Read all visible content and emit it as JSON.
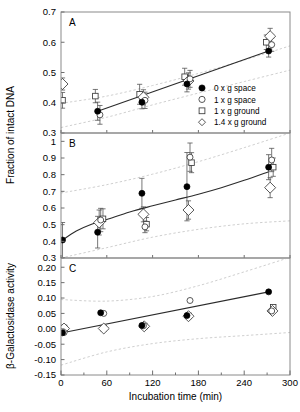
{
  "figure": {
    "xlabel": "Incubation time (min)",
    "ylabel_top": "Fraction of intact DNA",
    "ylabel_bottom": "β-Galactosidase activity",
    "panel_letters": [
      "A",
      "B",
      "C"
    ]
  },
  "legend": {
    "position": "panel-A-lower-right",
    "entries": [
      {
        "marker": "filled-circle",
        "label": "0 x g space"
      },
      {
        "marker": "open-circle",
        "label": "1 x g space"
      },
      {
        "marker": "open-square",
        "label": "1 x g ground"
      },
      {
        "marker": "open-diamond",
        "label": "1.4 x g ground"
      }
    ]
  },
  "colors": {
    "filled_marker": "#000000",
    "open_marker_stroke": "#3a3a3a",
    "fit_line": "#2b2b2b",
    "confidence_band": "#c9c9c9",
    "frame": "#8a8a8a",
    "background": "#ffffff"
  },
  "chart_data": [
    {
      "type": "scatter",
      "panel": "A",
      "title": "A",
      "xlabel": "",
      "ylabel": "Fraction of intact DNA",
      "xlim": [
        0,
        300
      ],
      "ylim": [
        0.3,
        0.7
      ],
      "xticks": [
        0,
        60,
        120,
        180,
        240,
        300
      ],
      "xticklabels": [
        "0",
        "60",
        "120",
        "180",
        "240",
        "300"
      ],
      "yticks": [
        0.3,
        0.4,
        0.5,
        0.6,
        0.7
      ],
      "yticklabels": [
        "0.3",
        "0.4",
        "0.5",
        "0.6",
        "0.7"
      ],
      "grid": false,
      "legend": true,
      "fit_line": {
        "x": [
          48,
          272
        ],
        "y": [
          0.372,
          0.571
        ]
      },
      "confidence_bands": [
        {
          "name": "upper",
          "x": [
            0,
            60,
            120,
            180,
            240,
            300
          ],
          "y": [
            0.398,
            0.422,
            0.457,
            0.497,
            0.541,
            0.588
          ]
        },
        {
          "name": "lower",
          "x": [
            0,
            60,
            120,
            180,
            240,
            300
          ],
          "y": [
            0.318,
            0.352,
            0.393,
            0.432,
            0.47,
            0.508
          ]
        }
      ],
      "series": [
        {
          "name": "0 x g space",
          "marker": "filled-circle",
          "x": [
            48,
            106,
            165,
            272
          ],
          "y": [
            0.372,
            0.402,
            0.462,
            0.571
          ],
          "yerr": [
            0.03,
            0.022,
            0.026,
            0.02
          ]
        },
        {
          "name": "1 x g space",
          "marker": "open-circle",
          "x": [
            51,
            110,
            169,
            276
          ],
          "y": [
            0.36,
            0.408,
            0.479,
            0.592
          ],
          "yerr": [
            0.031,
            0.027,
            0.028,
            0.022
          ]
        },
        {
          "name": "1 x g ground",
          "marker": "open-square",
          "x": [
            2,
            45,
            103,
            162,
            269
          ],
          "y": [
            0.408,
            0.422,
            0.428,
            0.486,
            0.6
          ],
          "yerr": [
            0.026,
            0.022,
            0.033,
            0.028,
            0.024
          ]
        },
        {
          "name": "1.4 x g ground",
          "marker": "open-diamond",
          "x": [
            2,
            108,
            167,
            274
          ],
          "y": [
            0.462,
            0.418,
            0.472,
            0.62
          ],
          "yerr": [
            0.02,
            0.025,
            0.027,
            0.026
          ]
        }
      ]
    },
    {
      "type": "scatter",
      "panel": "B",
      "title": "B",
      "xlabel": "",
      "ylabel": "Fraction of intact DNA",
      "xlim": [
        0,
        300
      ],
      "ylim": [
        0.3,
        1.05
      ],
      "xticks": [
        0,
        60,
        120,
        180,
        240,
        300
      ],
      "xticklabels": [
        "0",
        "60",
        "120",
        "180",
        "240",
        "300"
      ],
      "yticks": [
        0.3,
        0.4,
        0.5,
        0.6,
        0.7,
        0.8,
        0.9,
        1.0
      ],
      "yticklabels": [
        "0.3",
        "0.4",
        "0.5",
        "0.6",
        "0.7",
        "0.8",
        "0.9",
        "1"
      ],
      "grid": false,
      "legend": false,
      "fit_line": {
        "x": [
          2,
          20,
          40,
          60,
          90,
          120,
          150,
          180,
          210,
          240,
          272
        ],
        "y": [
          0.408,
          0.462,
          0.503,
          0.531,
          0.576,
          0.613,
          0.648,
          0.683,
          0.722,
          0.766,
          0.818
        ]
      },
      "confidence_bands": [
        {
          "name": "upper",
          "x": [
            0,
            60,
            120,
            180,
            240,
            300
          ],
          "y": [
            0.69,
            0.74,
            0.803,
            0.878,
            0.962,
            1.05
          ]
        },
        {
          "name": "lower",
          "x": [
            0,
            60,
            120,
            180,
            240,
            300
          ],
          "y": [
            0.3,
            0.362,
            0.425,
            0.472,
            0.505,
            0.523
          ]
        }
      ],
      "series": [
        {
          "name": "0 x g space",
          "marker": "filled-circle",
          "x": [
            2,
            48,
            106,
            165,
            272
          ],
          "y": [
            0.408,
            0.455,
            0.688,
            0.728,
            0.845
          ],
          "yerr": [
            0.105,
            0.095,
            0.09,
            0.205,
            0.075
          ]
        },
        {
          "name": "1 x g space",
          "marker": "open-circle",
          "x": [
            52,
            110,
            169,
            276
          ],
          "y": [
            0.528,
            0.487,
            0.905,
            0.888
          ],
          "yerr": [
            0.07,
            0.035,
            0.085,
            0.07
          ]
        },
        {
          "name": "1 x g ground",
          "marker": "open-square",
          "x": [
            55,
            112,
            171,
            278
          ],
          "y": [
            0.535,
            0.503,
            0.872,
            0.845
          ],
          "yerr": [
            0.06,
            0.04,
            0.06,
            0.055
          ]
        },
        {
          "name": "1.4 x g ground",
          "marker": "open-diamond",
          "x": [
            50,
            108,
            167,
            274
          ],
          "y": [
            0.513,
            0.562,
            0.588,
            0.722
          ],
          "yerr": [
            0.075,
            0.045,
            0.055,
            0.06
          ]
        }
      ]
    },
    {
      "type": "scatter",
      "panel": "C",
      "title": "C",
      "xlabel": "Incubation time (min)",
      "ylabel": "β-Galactosidase activity",
      "xlim": [
        0,
        300
      ],
      "ylim": [
        -0.15,
        0.23
      ],
      "xticks": [
        0,
        60,
        120,
        180,
        240,
        300
      ],
      "xticklabels": [
        "0",
        "60",
        "120",
        "180",
        "240",
        "300"
      ],
      "yticks": [
        -0.15,
        -0.1,
        -0.05,
        0.0,
        0.05,
        0.1,
        0.15,
        0.2
      ],
      "yticklabels": [
        "-0.15",
        "-0.10",
        "-0.05",
        "0.00",
        "0.05",
        "0.10",
        "0.15",
        "0.20"
      ],
      "grid": false,
      "legend": false,
      "fit_line": {
        "x": [
          2,
          272
        ],
        "y": [
          -0.013,
          0.12
        ]
      },
      "confidence_bands": [
        {
          "name": "upper",
          "x": [
            0,
            60,
            120,
            180,
            240,
            300
          ],
          "y": [
            0.095,
            0.09,
            0.105,
            0.14,
            0.185,
            0.232
          ]
        },
        {
          "name": "lower",
          "x": [
            0,
            60,
            120,
            180,
            240,
            300
          ],
          "y": [
            -0.118,
            -0.075,
            -0.048,
            -0.032,
            -0.022,
            -0.012
          ]
        }
      ],
      "series": [
        {
          "name": "0 x g space",
          "marker": "filled-circle",
          "x": [
            2,
            52,
            106,
            165,
            272
          ],
          "y": [
            -0.013,
            0.052,
            0.011,
            0.043,
            0.12
          ],
          "yerr": [
            0,
            0,
            0,
            0,
            0
          ]
        },
        {
          "name": "1 x g space",
          "marker": "open-circle",
          "x": [
            4,
            56,
            108,
            169,
            276
          ],
          "y": [
            -0.012,
            0.05,
            0.01,
            0.092,
            0.058
          ],
          "yerr": [
            0,
            0,
            0,
            0,
            0
          ]
        },
        {
          "name": "1 x g ground",
          "marker": "open-square",
          "x": [
            4,
            56,
            109,
            167,
            278
          ],
          "y": [
            0.003,
            0.002,
            0.009,
            0.042,
            0.07
          ],
          "yerr": [
            0,
            0,
            0,
            0,
            0
          ]
        },
        {
          "name": "1.4 x g ground",
          "marker": "open-diamond",
          "x": [
            4,
            56,
            109,
            167,
            277
          ],
          "y": [
            0.001,
            0.001,
            0.008,
            0.041,
            0.058
          ],
          "yerr": [
            0,
            0,
            0,
            0,
            0
          ]
        }
      ]
    }
  ]
}
